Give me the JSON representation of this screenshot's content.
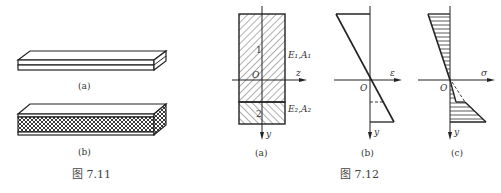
{
  "figure_7_11": {
    "caption": "图 7.11",
    "sub_a": "(a)",
    "sub_b": "(b)"
  },
  "figure_7_12": {
    "caption": "图 7.12",
    "panel_a": {
      "label": "(a)",
      "region1_number": "1",
      "region2_number": "2",
      "region1_props": "E₁,A₁",
      "region2_props": "E₂,A₂",
      "origin": "O",
      "z_axis": "z",
      "y_axis": "y"
    },
    "panel_b": {
      "label": "(b)",
      "origin": "O",
      "x_axis": "ε",
      "y_axis": "y"
    },
    "panel_c": {
      "label": "(c)",
      "origin": "O",
      "x_axis": "σ",
      "y_axis": "y"
    }
  }
}
